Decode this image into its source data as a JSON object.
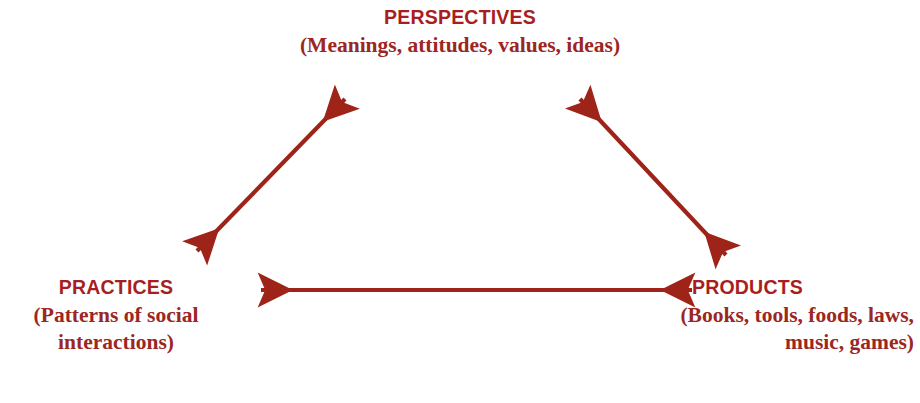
{
  "diagram": {
    "colors": {
      "heading": "#a81e1e",
      "description": "#9c2622",
      "arrow": "#9e2318",
      "background": "#ffffff"
    },
    "nodes": [
      {
        "id": "perspectives",
        "title": "PERSPECTIVES",
        "description": "(Meanings, attitudes, values, ideas)"
      },
      {
        "id": "practices",
        "title": "PRACTICES",
        "description_line1": "(Patterns of social",
        "description_line2": "interactions)"
      },
      {
        "id": "products",
        "title": "PRODUCTS",
        "description_line1": "(Books, tools, foods, laws,",
        "description_line2": "music, games)"
      }
    ],
    "connectors": [
      {
        "id": "practices-perspectives",
        "kind": "double-headed-arrow",
        "from": "practices",
        "to": "perspectives",
        "x1": 190,
        "y1": 258,
        "x2": 352,
        "y2": 92
      },
      {
        "id": "perspectives-products",
        "kind": "double-headed-arrow",
        "from": "perspectives",
        "to": "products",
        "x1": 573,
        "y1": 92,
        "x2": 733,
        "y2": 262
      },
      {
        "id": "practices-products",
        "kind": "double-headed-arrow",
        "from": "practices",
        "to": "products",
        "x1": 253,
        "y1": 290,
        "x2": 700,
        "y2": 290
      }
    ]
  }
}
